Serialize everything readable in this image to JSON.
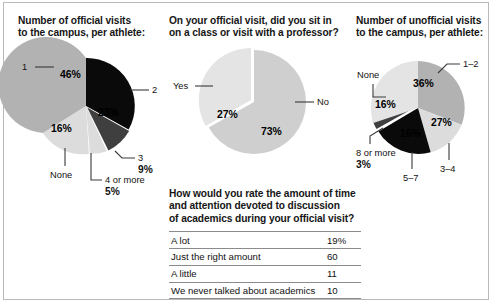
{
  "colors": {
    "dark_gray": "#b2b2b2",
    "light_gray": "#dcdcdc",
    "black": "#0a0a0a",
    "mid_dark": "#3f3f3f",
    "sitin_main": "#cfcfcf",
    "sitin_alt": "#e4e4e4",
    "frame": "#b9b9bd",
    "text": "#111111"
  },
  "panels": {
    "official": {
      "title": "Number of official visits\nto the campus, per athlete:"
    },
    "sitin": {
      "title": "On your official visit, did you sit in\non a class or visit with a professor?"
    },
    "unofficial": {
      "title": "Number of unofficial visits\nto the campus, per athlete:"
    },
    "rating": {
      "title": "How would you rate the amount of time\nand attention devoted to discussion\nof academics during your official visit?"
    }
  },
  "chart_data": [
    {
      "type": "pie",
      "id": "official-visits",
      "title": "Number of official visits to the campus, per athlete:",
      "categories": [
        "1",
        "2",
        "3",
        "4 or more",
        "None"
      ],
      "values": [
        46,
        23,
        9,
        5,
        16
      ],
      "value_labels": [
        "46%",
        "23%",
        "9%",
        "5%",
        "16%"
      ],
      "colors": [
        "#b2b2b2",
        "#0a0a0a",
        "#3f3f3f",
        "#dcdcdc",
        "#dcdcdc"
      ],
      "legend": "callouts"
    },
    {
      "type": "pie",
      "id": "sit-in-class",
      "title": "On your official visit, did you sit in on a class or visit with a professor?",
      "categories": [
        "No",
        "Yes"
      ],
      "values": [
        73,
        27
      ],
      "value_labels": [
        "73%",
        "27%"
      ],
      "colors": [
        "#cfcfcf",
        "#e4e4e4"
      ],
      "legend": "callouts"
    },
    {
      "type": "pie",
      "id": "unofficial-visits",
      "title": "Number of unofficial visits to the campus, per athlete:",
      "categories": [
        "1–2",
        "3–4",
        "5–7",
        "8 or more",
        "None"
      ],
      "values": [
        36,
        27,
        16,
        3,
        16
      ],
      "value_labels": [
        "36%",
        "27%",
        "16%",
        "3%",
        "16%"
      ],
      "colors": [
        "#b2b2b2",
        "#dcdcdc",
        "#0a0a0a",
        "#3f3f3f",
        "#e4e4e4"
      ],
      "legend": "callouts"
    },
    {
      "type": "table",
      "id": "academics-rating",
      "title": "How would you rate the amount of time and attention devoted to discussion of academics during your official visit?",
      "categories": [
        "A lot",
        "Just the right amount",
        "A little",
        "We never talked about academics"
      ],
      "values": [
        19,
        60,
        11,
        10
      ],
      "value_labels": [
        "19%",
        "60",
        "11",
        "10"
      ]
    }
  ],
  "official_labels": {
    "one": "1",
    "two": "2",
    "three": "3",
    "three_pct": "9%",
    "four_or_more": "4 or more",
    "four_pct": "5%",
    "none": "None",
    "pct_46": "46%",
    "pct_23": "23%",
    "pct_16": "16%"
  },
  "sitin_labels": {
    "yes": "Yes",
    "no": "No",
    "pct_27": "27%",
    "pct_73": "73%"
  },
  "unofficial_labels": {
    "one_two": "1–2",
    "three_four": "3–4",
    "five_seven": "5–7",
    "eight_or_more": "8 or more",
    "eight_pct": "3%",
    "none": "None",
    "pct_36": "36%",
    "pct_27": "27%",
    "pct_16_black": "16%",
    "pct_16_none": "16%"
  },
  "rating_rows": [
    {
      "label": "A lot",
      "value": "19%"
    },
    {
      "label": "Just the right amount",
      "value": "60"
    },
    {
      "label": "A little",
      "value": "11"
    },
    {
      "label": "We never talked about academics",
      "value": "10"
    }
  ]
}
